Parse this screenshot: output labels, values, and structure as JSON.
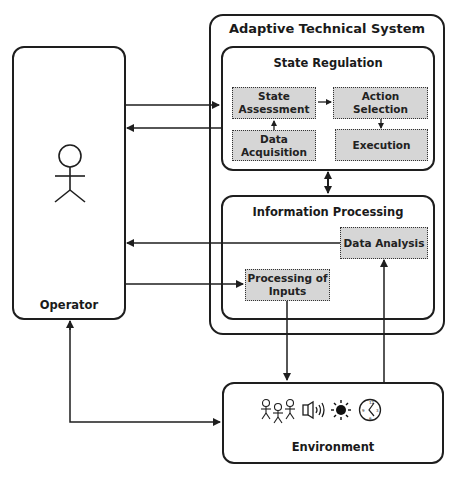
{
  "system": {
    "title": "Adaptive Technical System",
    "state_regulation": {
      "title": "State Regulation",
      "blocks": {
        "state_assessment": "State Assessment",
        "data_acquisition": "Data Acquisition",
        "action_selection": "Action Selection",
        "execution": "Execution"
      }
    },
    "information_processing": {
      "title": "Information Processing",
      "blocks": {
        "data_analysis": "Data Analysis",
        "processing_of_inputs": "Processing of Inputs"
      }
    }
  },
  "operator": {
    "label": "Operator",
    "icon": "stick-figure-icon"
  },
  "environment": {
    "label": "Environment",
    "icons": [
      "people-icon",
      "speaker-icon",
      "sun-icon",
      "clock-icon"
    ]
  }
}
